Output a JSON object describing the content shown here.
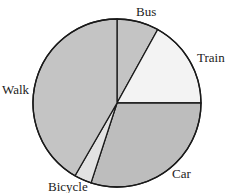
{
  "chart_data": {
    "type": "pie",
    "title": "",
    "start_angle_deg": 0,
    "direction": "clockwise",
    "slices": [
      {
        "label": "Bus",
        "angle_deg": 29,
        "percent": 8,
        "color": "#c4c4c4"
      },
      {
        "label": "Train",
        "angle_deg": 61,
        "percent": 17,
        "color": "#f3f3f3"
      },
      {
        "label": "Car",
        "angle_deg": 108,
        "percent": 30,
        "color": "#bdbdbd"
      },
      {
        "label": "Bicycle",
        "angle_deg": 12,
        "percent": 3,
        "color": "#e2e2e2"
      },
      {
        "label": "Walk",
        "angle_deg": 150,
        "percent": 42,
        "color": "#c4c4c4"
      }
    ],
    "categories": [
      "Bus",
      "Train",
      "Car",
      "Bicycle",
      "Walk"
    ],
    "values": [
      8,
      17,
      30,
      3,
      42
    ],
    "legend": "none (direct labels)"
  },
  "labels": {
    "bus": "Bus",
    "train": "Train",
    "car": "Car",
    "bicycle": "Bicycle",
    "walk": "Walk"
  }
}
